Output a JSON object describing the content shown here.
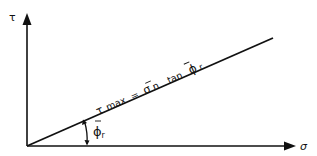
{
  "diagram": {
    "type": "mohr-coulomb-failure-envelope",
    "y_axis_label": "τ",
    "x_axis_label": "σ",
    "envelope_equation": {
      "lhs": "τ",
      "lhs_sub": "max",
      "equals": "=",
      "sigma": "σ",
      "sigma_sub": "n",
      "tan": "tan",
      "phi": "ϕ",
      "phi_sub": "r"
    },
    "angle_label": {
      "phi": "ϕ",
      "phi_sub": "r"
    },
    "colors": {
      "line": "#111111",
      "background": "#ffffff"
    }
  }
}
